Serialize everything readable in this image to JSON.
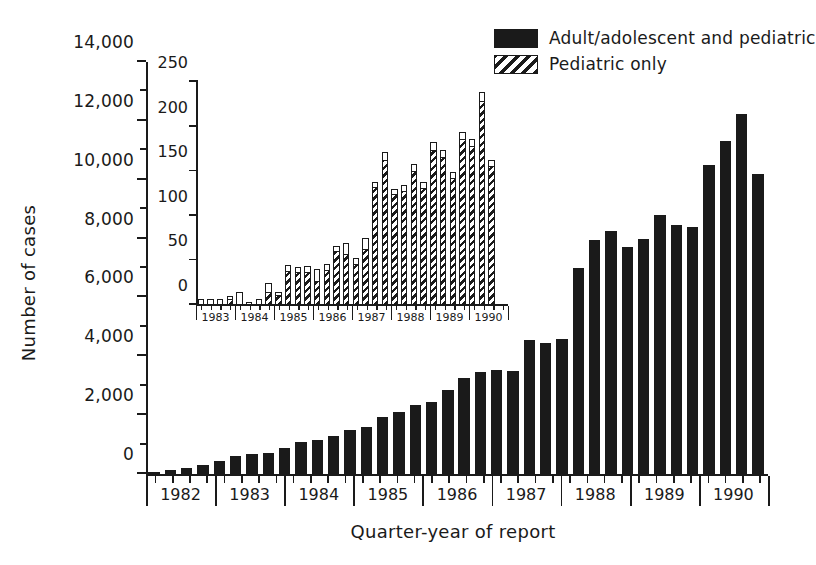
{
  "figure": {
    "ylabel": "Number of cases",
    "xlabel": "Quarter-year of report"
  },
  "legend": {
    "items": [
      {
        "label": "Adult/adolescent and pediatric",
        "pattern": "solid",
        "color": "#1a1a1a"
      },
      {
        "label": "Pediatric only",
        "pattern": "hatch",
        "color": "#1a1a1a"
      }
    ]
  },
  "main_axis": {
    "yticks": [
      "0",
      "2,000",
      "4,000",
      "6,000",
      "8,000",
      "10,000",
      "12,000",
      "14,000"
    ],
    "years": [
      "1982",
      "1983",
      "1984",
      "1985",
      "1986",
      "1987",
      "1988",
      "1989",
      "1990"
    ]
  },
  "inset_axis": {
    "yticks": [
      "0",
      "50",
      "100",
      "150",
      "200",
      "250"
    ],
    "years": [
      "1983",
      "1984",
      "1985",
      "1986",
      "1987",
      "1988",
      "1989",
      "1990"
    ]
  },
  "chart_data": [
    {
      "id": "main",
      "type": "bar",
      "title": "",
      "xlabel": "Quarter-year of report",
      "ylabel": "Number of cases",
      "ylim": [
        0,
        14000
      ],
      "ytick_step": 2000,
      "yminor_step": 1000,
      "grid": false,
      "legend_position": "top-right",
      "series_name": "Adult/adolescent and pediatric",
      "fill": "solid-black",
      "categories": [
        "1982 Q1",
        "1982 Q2",
        "1982 Q3",
        "1982 Q4",
        "1983 Q1",
        "1983 Q2",
        "1983 Q3",
        "1983 Q4",
        "1984 Q1",
        "1984 Q2",
        "1984 Q3",
        "1984 Q4",
        "1985 Q1",
        "1985 Q2",
        "1985 Q3",
        "1985 Q4",
        "1986 Q1",
        "1986 Q2",
        "1986 Q3",
        "1986 Q4",
        "1987 Q1",
        "1987 Q2",
        "1987 Q3",
        "1987 Q4",
        "1988 Q1",
        "1988 Q2",
        "1988 Q3",
        "1988 Q4",
        "1989 Q1",
        "1989 Q2",
        "1989 Q3",
        "1989 Q4",
        "1990 Q1",
        "1990 Q2",
        "1990 Q3",
        "1990 Q4"
      ],
      "values": [
        60,
        150,
        220,
        300,
        440,
        620,
        680,
        700,
        900,
        1080,
        1150,
        1300,
        1500,
        1600,
        1950,
        2100,
        2350,
        2450,
        2850,
        3250,
        3450,
        3550,
        3500,
        4550,
        4450,
        4600,
        7000,
        7950,
        8250,
        7700,
        8000,
        8800,
        8450,
        8400,
        10500,
        11300,
        12250,
        10200
      ],
      "note": "36 quarterly bars, 1982 Q1 through 1990 Q4"
    },
    {
      "id": "inset",
      "type": "bar",
      "title": "",
      "xlabel": "",
      "ylabel": "",
      "ylim": [
        0,
        250
      ],
      "ytick_step": 50,
      "grid": false,
      "series_name": "Pediatric only",
      "fill": "diagonal-hatch",
      "categories": [
        "1983 Q1",
        "1983 Q2",
        "1983 Q3",
        "1983 Q4",
        "1984 Q1",
        "1984 Q2",
        "1984 Q3",
        "1984 Q4",
        "1985 Q1",
        "1985 Q2",
        "1985 Q3",
        "1985 Q4",
        "1986 Q1",
        "1986 Q2",
        "1986 Q3",
        "1986 Q4",
        "1987 Q1",
        "1987 Q2",
        "1987 Q3",
        "1987 Q4",
        "1988 Q1",
        "1988 Q2",
        "1988 Q3",
        "1988 Q4",
        "1989 Q1",
        "1989 Q2",
        "1989 Q3",
        "1989 Q4",
        "1990 Q1",
        "1990 Q2",
        "1990 Q3",
        "1990 Q4"
      ],
      "values": [
        7,
        7,
        7,
        10,
        15,
        3,
        7,
        25,
        15,
        45,
        43,
        44,
        40,
        46,
        66,
        69,
        53,
        75,
        138,
        172,
        130,
        135,
        158,
        138,
        183,
        174,
        149,
        194,
        186,
        239,
        163,
        0
      ],
      "pediatric_filled": [
        0,
        0,
        0,
        6,
        0,
        0,
        0,
        13,
        10,
        37,
        36,
        36,
        26,
        38,
        59,
        56,
        45,
        62,
        131,
        162,
        123,
        127,
        149,
        130,
        173,
        165,
        141,
        185,
        177,
        228,
        155,
        0
      ],
      "note": "32 quarterly bars, 1983 Q1 through 1990 Q4; hatched portion = pediatric cases, open top = remainder of bar outline"
    }
  ]
}
